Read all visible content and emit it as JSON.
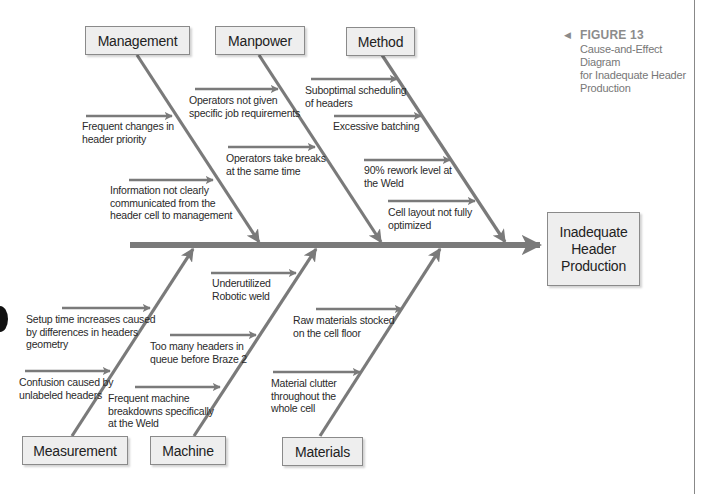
{
  "figure": {
    "number_label": "FIGURE 13",
    "title": "Cause-and-Effect Diagram\nfor Inadequate Header\nProduction",
    "marker": "◀"
  },
  "effect": {
    "label_lines": [
      "Inadequate",
      "Header",
      "Production"
    ]
  },
  "categories": {
    "top": [
      {
        "label": "Management"
      },
      {
        "label": "Manpower"
      },
      {
        "label": "Method"
      }
    ],
    "bottom": [
      {
        "label": "Measurement"
      },
      {
        "label": "Machine"
      },
      {
        "label": "Materials"
      }
    ]
  },
  "causes": {
    "management": [
      "Frequent changes in\nheader priority",
      "Information not clearly\ncommunicated from the\nheader cell to management"
    ],
    "manpower": [
      "Operators not given\nspecific job requirements",
      "Operators take breaks\nat the same time"
    ],
    "method": [
      "Suboptimal scheduling\nof headers",
      "Excessive batching",
      "90% rework level at\nthe Weld",
      "Cell layout not fully\noptimized"
    ],
    "measurement": [
      "Setup time increases caused\nby differences in headers\ngeometry",
      "Confusion caused by\nunlabeled headers"
    ],
    "machine": [
      "Underutilized\nRobotic weld",
      "Too many headers in\nqueue before Braze 2",
      "Frequent machine\nbreakdowns specifically\nat the Weld"
    ],
    "materials": [
      "Raw materials stocked\non the cell floor",
      "Material clutter\nthroughout the\nwhole  cell"
    ]
  },
  "colors": {
    "bone": "#7a7a7a",
    "box_fill": "#eeeeee",
    "box_border": "#8a8a8a",
    "caption_gray": "#8c8c8c"
  }
}
